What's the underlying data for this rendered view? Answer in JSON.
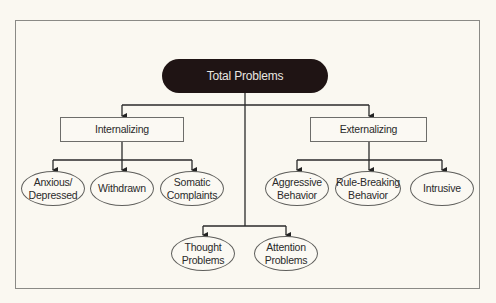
{
  "diagram": {
    "type": "hierarchy",
    "root": {
      "label": "Total Problems"
    },
    "internalizing": {
      "label": "Internalizing",
      "children": [
        {
          "line1": "Anxious/",
          "line2": "Depressed"
        },
        {
          "line1": "Withdrawn",
          "line2": ""
        },
        {
          "line1": "Somatic",
          "line2": "Complaints"
        }
      ]
    },
    "externalizing": {
      "label": "Externalizing",
      "children": [
        {
          "line1": "Aggressive",
          "line2": "Behavior"
        },
        {
          "line1": "Rule-Breaking",
          "line2": "Behavior"
        },
        {
          "line1": "Intrusive",
          "line2": ""
        }
      ]
    },
    "other": {
      "children": [
        {
          "line1": "Thought",
          "line2": "Problems"
        },
        {
          "line1": "Attention",
          "line2": "Problems"
        }
      ]
    }
  },
  "colors": {
    "background": "#faf8f1",
    "root_fill": "#1f1414",
    "root_text": "#e9e6e0",
    "line": "#2a2a2a",
    "border": "#8a8a86"
  }
}
